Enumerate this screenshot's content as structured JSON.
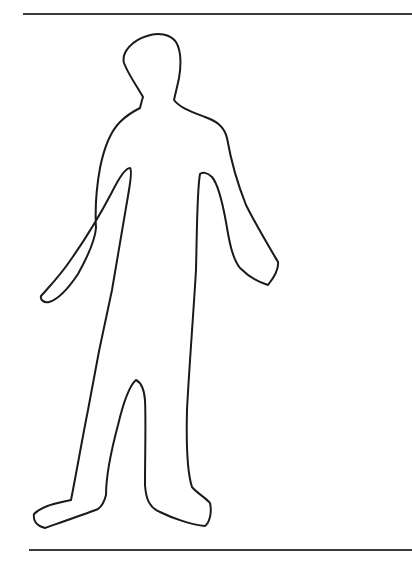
{
  "figure": {
    "stroke_color": "#1a1a1a",
    "background_color": "#ffffff",
    "rule_color": "#3a3a3a"
  }
}
